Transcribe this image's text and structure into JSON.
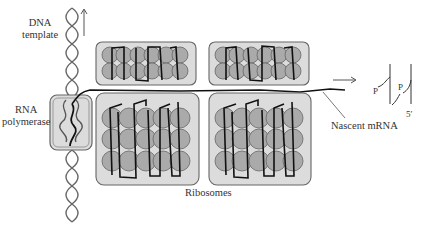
{
  "diagram": {
    "type": "biology-illustration",
    "labels": {
      "dna_template_line1": "DNA",
      "dna_template_line2": "template",
      "rna_polymerase_line1": "RNA",
      "rna_polymerase_line2": "polymerase",
      "ribosomes": "Ribosomes",
      "nascent_mrna": "Nascent mRNA",
      "phosphate_1": "P",
      "phosphate_2": "P",
      "five_prime": "5′"
    },
    "components": [
      "DNA template helix",
      "RNA polymerase",
      "4 ribosomes",
      "nascent mRNA",
      "direction arrows"
    ],
    "colors": {
      "box_fill": "#d9d9d9",
      "subunit_fill": "#a9a9a9",
      "outline": "#555555",
      "strand": "#111111"
    }
  }
}
